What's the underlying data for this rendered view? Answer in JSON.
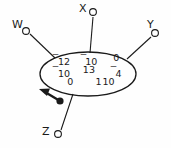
{
  "diagram": {
    "type": "graph-with-matrix",
    "nodes": [
      {
        "id": "W",
        "label": "W",
        "cx": 26,
        "cy": 31,
        "label_x": 12,
        "label_y": 19
      },
      {
        "id": "X",
        "label": "X",
        "cx": 93,
        "cy": 12,
        "label_x": 79,
        "label_y": 3
      },
      {
        "id": "Y",
        "label": "Y",
        "cx": 155,
        "cy": 33,
        "label_x": 147,
        "label_y": 19
      },
      {
        "id": "Z",
        "label": "Z",
        "cx": 58,
        "cy": 134,
        "label_x": 42,
        "label_y": 126
      }
    ],
    "ellipse": {
      "cx": 88,
      "cy": 74,
      "rx": 48,
      "ry": 22
    },
    "pointer": {
      "label": "arrow-pointer",
      "dot_x": 58,
      "dot_y": 101
    },
    "matrix": {
      "rows": [
        [
          "⁻12",
          "⁻10",
          "0"
        ],
        [
          "⁻10",
          "13",
          "⁻4"
        ],
        [
          "0",
          "1",
          "10"
        ]
      ],
      "cells": {
        "r1c1_sign": "‾",
        "r1c1_value": "12",
        "r1c2_sign": "‾",
        "r1c2_value": "10",
        "r1c3_sign": "",
        "r1c3_value": "0",
        "r2c1_sign": "‾",
        "r2c1_value": "10",
        "r2c2_sign": "",
        "r2c2_value": "13",
        "r2c3_sign": "‾",
        "r2c3_value": "4",
        "r3c1_sign": "",
        "r3c1_value": "0",
        "r3c2_sign": "",
        "r3c2_value": "1",
        "r3c3_sign": "",
        "r3c3_value": "10"
      }
    },
    "colors": {
      "stroke": "#1a1a1a",
      "text": "#1a1a1a",
      "background": "#fefefe"
    }
  }
}
